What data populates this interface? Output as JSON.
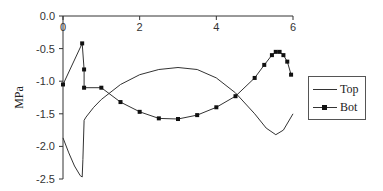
{
  "chart_data": {
    "type": "line",
    "title": "",
    "xlabel": "",
    "ylabel": "MPa",
    "xlim": [
      0,
      6
    ],
    "ylim": [
      -2.5,
      0.0
    ],
    "x_ticks": [
      "0",
      "2",
      "4",
      "6"
    ],
    "y_ticks": [
      "0.0",
      "-0.5",
      "-1.0",
      "-1.5",
      "-2.0",
      "-2.5"
    ],
    "grid": false,
    "legend_position": "right",
    "series": [
      {
        "name": "Top",
        "marker": "none",
        "x": [
          0.0,
          0.15,
          0.3,
          0.45,
          0.5,
          0.52,
          0.55,
          0.6,
          0.8,
          1.0,
          1.5,
          2.0,
          2.5,
          3.0,
          3.5,
          4.0,
          4.5,
          5.0,
          5.3,
          5.55,
          5.75,
          6.0
        ],
        "y": [
          -1.87,
          -2.1,
          -2.3,
          -2.45,
          -2.47,
          -2.2,
          -1.6,
          -1.55,
          -1.4,
          -1.28,
          -1.05,
          -0.9,
          -0.82,
          -0.79,
          -0.82,
          -0.95,
          -1.18,
          -1.5,
          -1.72,
          -1.82,
          -1.75,
          -1.5
        ]
      },
      {
        "name": "Bot",
        "marker": "square",
        "x": [
          0.0,
          0.5,
          0.55,
          0.55,
          1.0,
          1.5,
          2.0,
          2.5,
          3.0,
          3.5,
          4.0,
          4.5,
          5.0,
          5.25,
          5.45,
          5.55,
          5.65,
          5.75,
          5.85,
          5.95
        ],
        "y": [
          -1.05,
          -0.42,
          -0.82,
          -1.1,
          -1.1,
          -1.32,
          -1.47,
          -1.57,
          -1.58,
          -1.52,
          -1.4,
          -1.23,
          -0.95,
          -0.75,
          -0.6,
          -0.55,
          -0.55,
          -0.6,
          -0.7,
          -0.9
        ]
      }
    ]
  },
  "legend": {
    "items": [
      {
        "label": "Top"
      },
      {
        "label": "Bot"
      }
    ]
  }
}
